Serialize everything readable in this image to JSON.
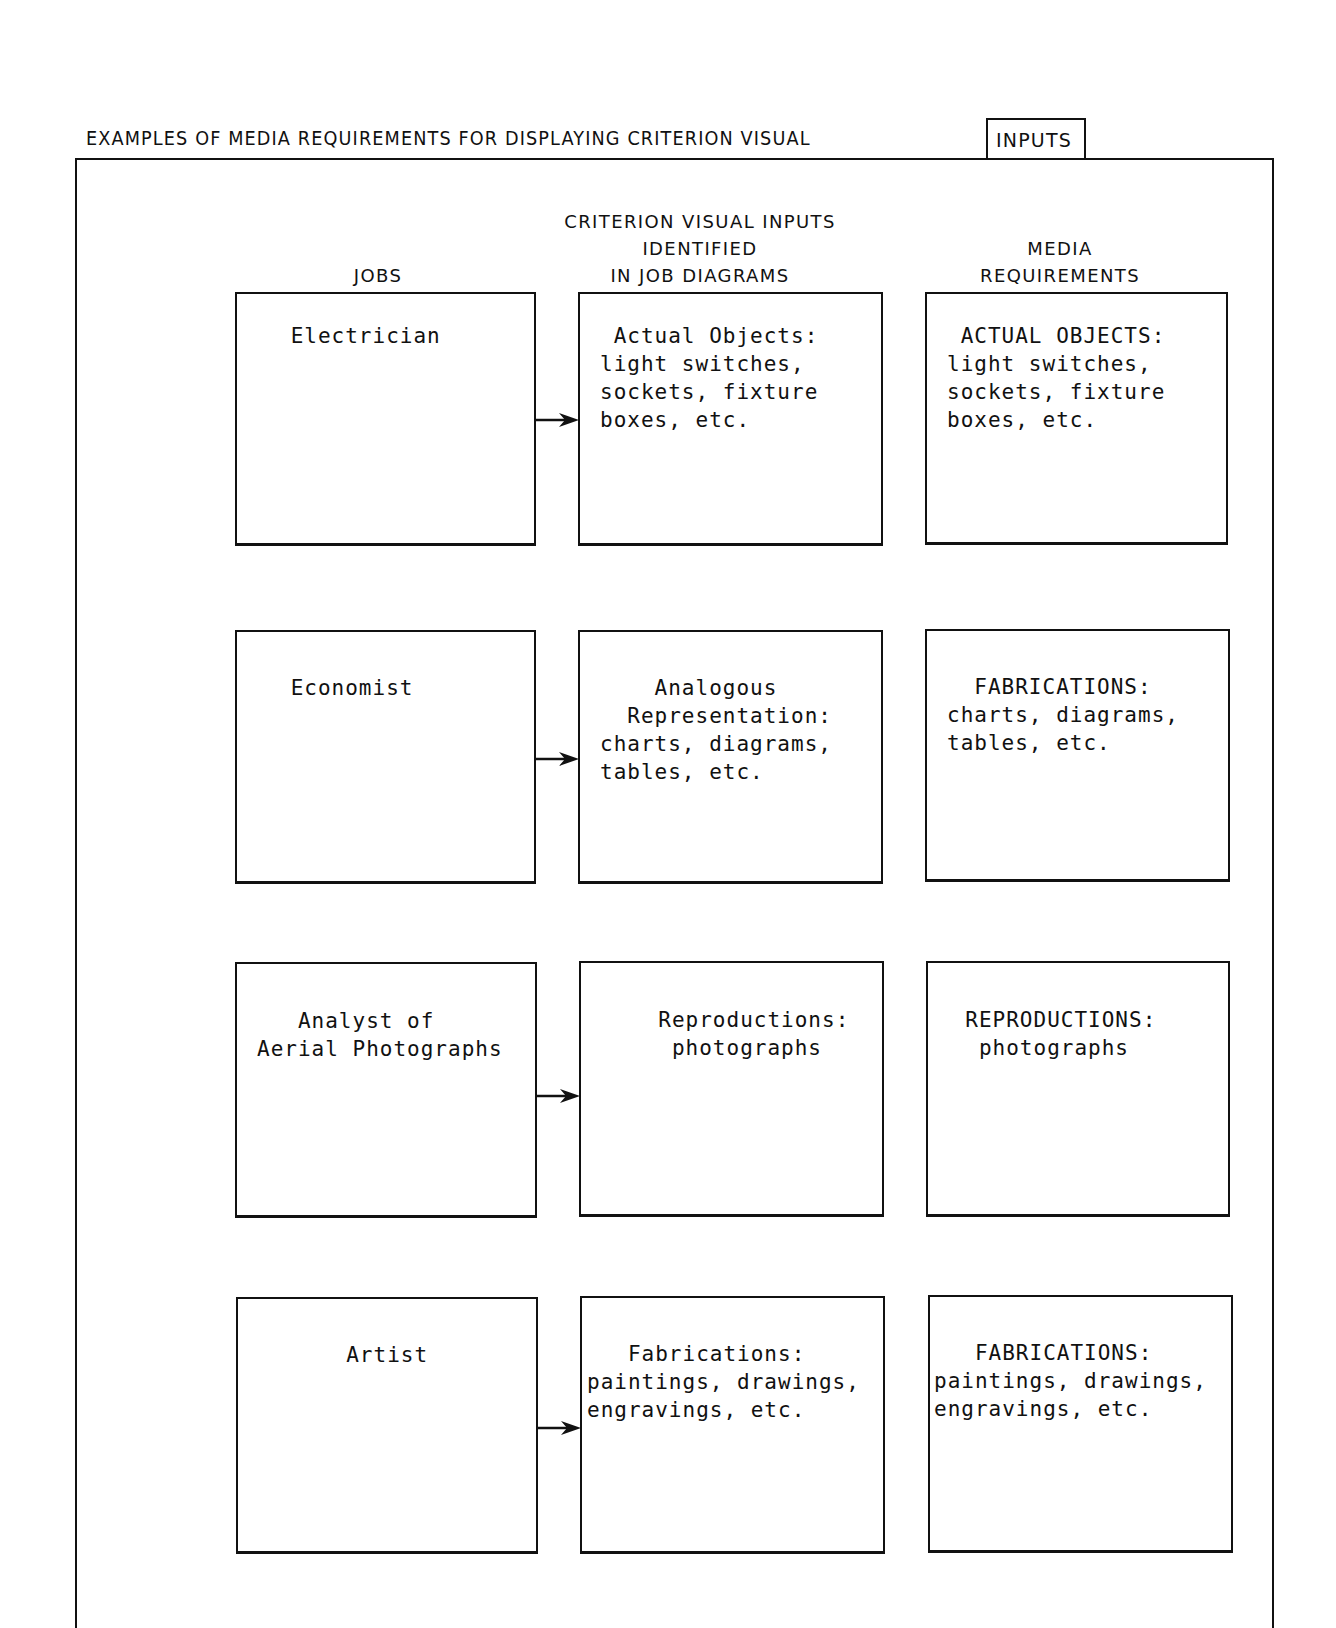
{
  "title": {
    "main": "EXAMPLES OF MEDIA REQUIREMENTS FOR DISPLAYING CRITERION VISUAL",
    "boxed": "INPUTS"
  },
  "columns": {
    "jobs": "JOBS",
    "criterion_line1": "CRITERION VISUAL INPUTS",
    "criterion_line2": "IDENTIFIED",
    "criterion_line3": "IN JOB DIAGRAMS",
    "media_line1": "MEDIA",
    "media_line2": "REQUIREMENTS"
  },
  "rows": [
    {
      "job": " Electrician",
      "criterion": " Actual Objects:\nlight switches,\nsockets, fixture\nboxes, etc.",
      "media": " ACTUAL OBJECTS:\nlight switches,\nsockets, fixture\nboxes, etc."
    },
    {
      "job": " Economist",
      "criterion": "    Analogous\n  Representation:\ncharts, diagrams,\ntables, etc.",
      "media": "  FABRICATIONS:\ncharts, diagrams,\ntables, etc."
    },
    {
      "job": "   Analyst of\nAerial Photographs",
      "criterion": "  Reproductions:\n   photographs",
      "media": "  REPRODUCTIONS:\n   photographs"
    },
    {
      "job": "     Artist",
      "criterion": "   Fabrications:\npaintings, drawings,\nengravings, etc.",
      "media": "   FABRICATIONS:\npaintings, drawings,\nengravings, etc."
    }
  ],
  "icons": {
    "arrow": "arrow-right-icon"
  },
  "colors": {
    "ink": "#111111",
    "paper": "#ffffff"
  }
}
